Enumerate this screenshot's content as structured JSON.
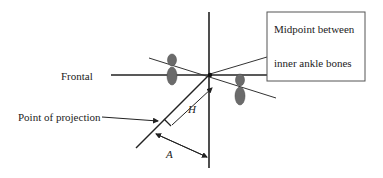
{
  "diagram": {
    "labels": {
      "frontal": "Frontal",
      "point_of_projection": "Point of projection",
      "midpoint_line1": "Midpoint between",
      "midpoint_line2": "inner ankle bones",
      "h": "H",
      "a": "A"
    },
    "colors": {
      "line": "#222222",
      "foot": "#6b6b6b",
      "box_border": "#555555"
    }
  }
}
